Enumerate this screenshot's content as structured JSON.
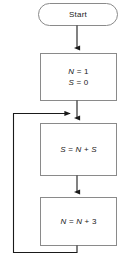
{
  "diagram": {
    "type": "flowchart",
    "title": "",
    "colors": {
      "shape_border": "#8a8a8a",
      "connector": "#1a1a1a",
      "background": "#ffffff",
      "text": "#1a1a1a"
    },
    "nodes": [
      {
        "id": "start",
        "shape": "terminator",
        "label": "Start",
        "lines": [
          "Start"
        ]
      },
      {
        "id": "init",
        "shape": "process",
        "label": "N = 1 S = 0",
        "lines": [
          "N = 1",
          "S = 0"
        ],
        "line1_var": "N",
        "line1_rest": " = 1",
        "line2_var": "S",
        "line2_rest": " = 0"
      },
      {
        "id": "sum",
        "shape": "process",
        "label": "S = N + S",
        "lines": [
          "S = N + S"
        ],
        "lhs": "S",
        "op1": " = ",
        "rhs1": "N",
        "op2": " + ",
        "rhs2": "S"
      },
      {
        "id": "increment",
        "shape": "process",
        "label": "N = N + 3",
        "lines": [
          "N = N + 3"
        ],
        "lhs": "N",
        "op1": " = ",
        "rhs1": "N",
        "op2": " + ",
        "rhs2": "3"
      }
    ],
    "edges": [
      {
        "id": "e1",
        "from": "start",
        "to": "init",
        "label": "",
        "direction": "down"
      },
      {
        "id": "e2",
        "from": "init",
        "to": "sum",
        "label": "",
        "direction": "down"
      },
      {
        "id": "e3",
        "from": "sum",
        "to": "increment",
        "label": "",
        "direction": "down"
      },
      {
        "id": "e4",
        "from": "increment",
        "to": "sum",
        "label": "",
        "direction": "loop-left-up"
      }
    ]
  }
}
